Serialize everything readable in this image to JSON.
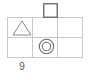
{
  "figure": {
    "caption": "9",
    "background_color": "#ffffff",
    "grid": {
      "line_color": "#c9c9c9",
      "columns": 3,
      "rows": 2,
      "left": 7,
      "right": 82,
      "top": 17,
      "bottom": 57,
      "x_positions": [
        7,
        32,
        57,
        82
      ],
      "y_positions": [
        17,
        37,
        57
      ]
    },
    "shapes": [
      {
        "id": "triangle",
        "name": "triangle-shape",
        "glyph": "triangle",
        "stroke_color": "#8a8a8a",
        "fill": "none",
        "x": 12,
        "y": 20,
        "width": 20,
        "height": 16,
        "cell": "row-1-col-1"
      },
      {
        "id": "square",
        "name": "square-shape",
        "glyph": "square",
        "stroke_color": "#6e6e6e",
        "fill": "none",
        "x": 43,
        "y": 3,
        "width": 15,
        "height": 15,
        "cell": "above-row-1-col-2"
      },
      {
        "id": "double-circle",
        "name": "double-circle-shape",
        "glyph": "double-circle",
        "stroke_color": "#6e6e6e",
        "fill": "none",
        "x": 38,
        "y": 37,
        "width": 17,
        "height": 17,
        "cell": "row-2-col-2"
      }
    ]
  }
}
